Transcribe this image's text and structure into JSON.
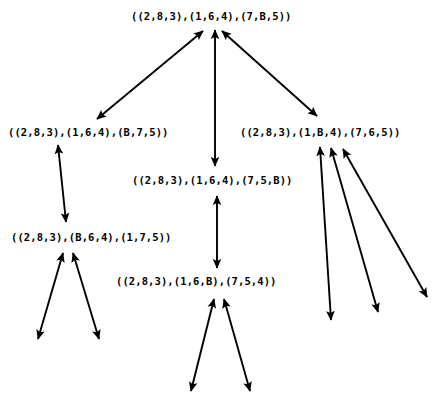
{
  "diagram": {
    "background_color": "#ffffff",
    "stroke_color": "#000000",
    "text_color": "#000000",
    "width": 436,
    "height": 398,
    "nodes": [
      {
        "id": "root",
        "label": "((2,8,3),(1,6,4),(7,B,5))",
        "x": 131,
        "y": 10
      },
      {
        "id": "left",
        "label": "((2,8,3),(1,6,4),(B,7,5))",
        "x": 8,
        "y": 126
      },
      {
        "id": "center",
        "label": "((2,8,3),(1,6,4),(7,5,B))",
        "x": 132,
        "y": 174
      },
      {
        "id": "right",
        "label": "((2,8,3),(1,B,4),(7,6,5))",
        "x": 240,
        "y": 126
      },
      {
        "id": "lower-left",
        "label": "((2,8,3),(B,6,4),(1,7,5))",
        "x": 11,
        "y": 231
      },
      {
        "id": "bottom-center",
        "label": "((2,8,3),(1,6,B),(7,5,4))",
        "x": 116,
        "y": 275
      }
    ],
    "edges": [
      {
        "id": "root-left",
        "x1": 203,
        "y1": 31,
        "x2": 97,
        "y2": 119
      },
      {
        "id": "root-center",
        "x1": 215,
        "y1": 30,
        "x2": 215,
        "y2": 166
      },
      {
        "id": "root-right",
        "x1": 222,
        "y1": 31,
        "x2": 317,
        "y2": 116
      },
      {
        "id": "left-lowerleft",
        "x1": 58,
        "y1": 145,
        "x2": 66,
        "y2": 222
      },
      {
        "id": "center-bottomcenter",
        "x1": 217,
        "y1": 196,
        "x2": 217,
        "y2": 268
      },
      {
        "id": "lowerleft-fringe-left",
        "x1": 63,
        "y1": 253,
        "x2": 38,
        "y2": 339
      },
      {
        "id": "lowerleft-fringe-right",
        "x1": 73,
        "y1": 253,
        "x2": 99,
        "y2": 339
      },
      {
        "id": "bottomcenter-fringe-left",
        "x1": 214,
        "y1": 299,
        "x2": 191,
        "y2": 391
      },
      {
        "id": "bottomcenter-fringe-right",
        "x1": 224,
        "y1": 299,
        "x2": 250,
        "y2": 391
      },
      {
        "id": "right-fringe-a",
        "x1": 320,
        "y1": 147,
        "x2": 331,
        "y2": 320
      },
      {
        "id": "right-fringe-b",
        "x1": 331,
        "y1": 148,
        "x2": 378,
        "y2": 312
      },
      {
        "id": "right-fringe-c",
        "x1": 343,
        "y1": 149,
        "x2": 427,
        "y2": 297
      }
    ]
  }
}
